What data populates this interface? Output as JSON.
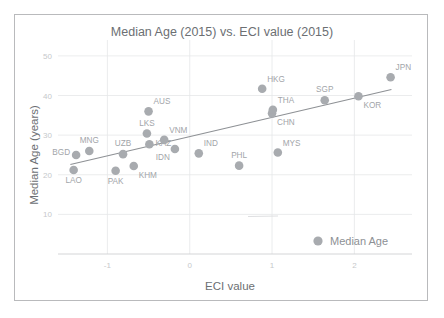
{
  "figure": {
    "title": "Median Age (2015) vs. ECI value (2015)",
    "x_axis_title": "ECI value",
    "y_axis_title": "Median Age (years)",
    "legend_label": "Median Age",
    "marker_color": "#a8abaf",
    "trendline_color": "#8e9195",
    "gridline_color": "#e6e7e9",
    "title_color": "#6c6f73",
    "label_color": "#a2a5a9",
    "tick_color": "#c6c8cb",
    "background_color": "#ffffff",
    "border_color": "#b9babc"
  },
  "chart_data": {
    "type": "scatter",
    "title": "Median Age (2015) vs. ECI value (2015)",
    "xlabel": "ECI value",
    "ylabel": "Median Age (years)",
    "xlim": [
      -1.6,
      2.7
    ],
    "ylim": [
      0,
      53
    ],
    "xticks": [
      -1,
      0,
      1,
      2
    ],
    "xtick_labels": [
      "-1",
      "0",
      "1",
      "2"
    ],
    "yticks": [
      10,
      20,
      30,
      40,
      50
    ],
    "ytick_labels": [
      "10",
      "20",
      "30",
      "40",
      "50"
    ],
    "grid": true,
    "legend": [
      "Median Age"
    ],
    "legend_position": "bottom-right",
    "series": [
      {
        "name": "Median Age",
        "points": [
          {
            "label": "BGD",
            "x": -1.38,
            "y": 25.0,
            "label_pos": "left"
          },
          {
            "label": "LAO",
            "x": -1.41,
            "y": 21.2,
            "label_pos": "below"
          },
          {
            "label": "MNG",
            "x": -1.22,
            "y": 26.0,
            "label_pos": "above"
          },
          {
            "label": "PAK",
            "x": -0.9,
            "y": 21.0,
            "label_pos": "below"
          },
          {
            "label": "UZB",
            "x": -0.81,
            "y": 25.2,
            "label_pos": "above"
          },
          {
            "label": "KHM",
            "x": -0.68,
            "y": 22.2,
            "label_pos": "below-right"
          },
          {
            "label": "LKS",
            "x": -0.52,
            "y": 30.4,
            "label_pos": "above"
          },
          {
            "label": "AUS",
            "x": -0.5,
            "y": 36.0,
            "label_pos": "above-right"
          },
          {
            "label": "KAZ",
            "x": -0.49,
            "y": 27.7,
            "label_pos": "right"
          },
          {
            "label": "VNM",
            "x": -0.31,
            "y": 28.8,
            "label_pos": "above-right"
          },
          {
            "label": "IDN",
            "x": -0.18,
            "y": 26.5,
            "label_pos": "below-left"
          },
          {
            "label": "IND",
            "x": 0.11,
            "y": 25.4,
            "label_pos": "above-right"
          },
          {
            "label": "PHL",
            "x": 0.6,
            "y": 22.3,
            "label_pos": "above"
          },
          {
            "label": "HKG",
            "x": 0.88,
            "y": 41.7,
            "label_pos": "above-right"
          },
          {
            "label": "CHN",
            "x": 1.0,
            "y": 35.5,
            "label_pos": "below-right"
          },
          {
            "label": "THA",
            "x": 1.01,
            "y": 36.4,
            "label_pos": "above-right"
          },
          {
            "label": "MYS",
            "x": 1.07,
            "y": 25.6,
            "label_pos": "above-right"
          },
          {
            "label": "SGP",
            "x": 1.64,
            "y": 38.8,
            "label_pos": "above"
          },
          {
            "label": "KOR",
            "x": 2.05,
            "y": 39.8,
            "label_pos": "below-right"
          },
          {
            "label": "JPN",
            "x": 2.44,
            "y": 44.6,
            "label_pos": "above-right"
          }
        ]
      }
    ],
    "trendline": {
      "type": "linear",
      "x_start": -1.45,
      "y_start": 22.6,
      "x_end": 2.45,
      "y_end": 41.5
    }
  }
}
